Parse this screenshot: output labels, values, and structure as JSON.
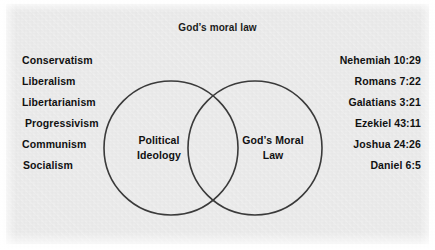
{
  "figure": {
    "title": "God’s moral law",
    "background_color": "#ececec",
    "stroke_color": "#3a3a3a",
    "text_color": "#111111"
  },
  "left_column": {
    "items": [
      {
        "label": "Conservatism"
      },
      {
        "label": "Liberalism"
      },
      {
        "label": "Libertarianism"
      },
      {
        "label": "Progressivism"
      },
      {
        "label": "Communism"
      },
      {
        "label": "Socialism"
      }
    ]
  },
  "right_column": {
    "items": [
      {
        "label": "Nehemiah 10:29"
      },
      {
        "label": "Romans 7:22"
      },
      {
        "label": "Galatians 3:21"
      },
      {
        "label": "Ezekiel 43:11"
      },
      {
        "label": "Joshua 24:26"
      },
      {
        "label": "Daniel 6:5"
      }
    ]
  },
  "venn": {
    "left_circle": {
      "label_line1": "Political",
      "label_line2": "Ideology",
      "cx": 171,
      "cy": 148,
      "r": 67
    },
    "right_circle": {
      "label_line1": "God’s Moral",
      "label_line2": "Law",
      "cx": 255,
      "cy": 148,
      "r": 67
    }
  },
  "chart_data": {
    "type": "diagram",
    "subtype": "venn",
    "title": "God’s moral law",
    "sets": [
      {
        "name": "Political Ideology",
        "members": [
          "Conservatism",
          "Liberalism",
          "Libertarianism",
          "Progressivism",
          "Communism",
          "Socialism"
        ]
      },
      {
        "name": "God’s Moral Law",
        "members": [
          "Nehemiah 10:29",
          "Romans 7:22",
          "Galatians 3:21",
          "Ezekiel 43:11",
          "Joshua 24:26",
          "Daniel 6:5"
        ]
      }
    ],
    "intersection_label": "",
    "legend": "none",
    "grid": false
  }
}
